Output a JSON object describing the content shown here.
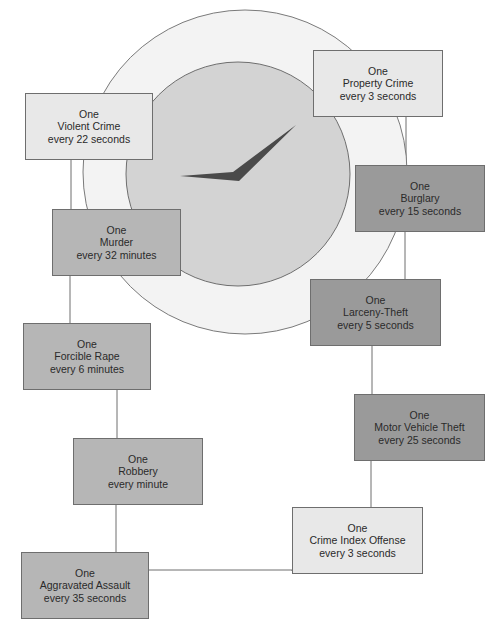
{
  "diagram": {
    "type": "crime-clock",
    "colors": {
      "background": "#ffffff",
      "outer_dial": "#f3f3f3",
      "inner_dial": "#d3d3d3",
      "hands": "#4a4a4a",
      "light_box": "#e8e8e8",
      "medium_box": "#b6b6b6",
      "dark_box": "#9a9a9a",
      "lines": "#6e6e6e"
    },
    "nodes": [
      {
        "id": "crime-index-offense",
        "line1": "One",
        "line2": "Crime Index Offense",
        "line3": "every 3 seconds",
        "shade": "light"
      },
      {
        "id": "violent-crime",
        "line1": "One",
        "line2": "Violent Crime",
        "line3": "every 22 seconds",
        "shade": "light"
      },
      {
        "id": "murder",
        "line1": "One",
        "line2": "Murder",
        "line3": "every 32 minutes",
        "shade": "medium"
      },
      {
        "id": "forcible-rape",
        "line1": "One",
        "line2": "Forcible Rape",
        "line3": "every 6 minutes",
        "shade": "medium"
      },
      {
        "id": "robbery",
        "line1": "One",
        "line2": "Robbery",
        "line3": "every minute",
        "shade": "medium"
      },
      {
        "id": "aggravated-assault",
        "line1": "One",
        "line2": "Aggravated Assault",
        "line3": "every 35 seconds",
        "shade": "medium"
      },
      {
        "id": "property-crime",
        "line1": "One",
        "line2": "Property Crime",
        "line3": "every 3 seconds",
        "shade": "light"
      },
      {
        "id": "burglary",
        "line1": "One",
        "line2": "Burglary",
        "line3": "every 15 seconds",
        "shade": "dark"
      },
      {
        "id": "larceny-theft",
        "line1": "One",
        "line2": "Larceny-Theft",
        "line3": "every 5 seconds",
        "shade": "dark"
      },
      {
        "id": "motor-vehicle-theft",
        "line1": "One",
        "line2": "Motor Vehicle Theft",
        "line3": "every 25 seconds",
        "shade": "dark"
      }
    ],
    "edges": [
      [
        "violent-crime",
        "murder"
      ],
      [
        "murder",
        "forcible-rape"
      ],
      [
        "forcible-rape",
        "robbery"
      ],
      [
        "robbery",
        "aggravated-assault"
      ],
      [
        "aggravated-assault",
        "crime-index-offense"
      ],
      [
        "property-crime",
        "burglary"
      ],
      [
        "burglary",
        "larceny-theft"
      ],
      [
        "larceny-theft",
        "motor-vehicle-theft"
      ],
      [
        "motor-vehicle-theft",
        "crime-index-offense"
      ]
    ]
  }
}
